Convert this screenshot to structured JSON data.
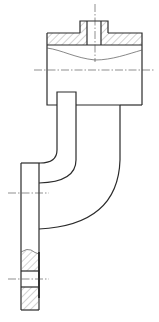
{
  "drawing": {
    "type": "mechanical-section-drawing",
    "subject": "curved pipe elbow with rectangular housing and flange",
    "colors": {
      "background": "#ffffff",
      "line": "#2b2b2b",
      "hatch": "#666666"
    },
    "parts": [
      {
        "name": "top-boss",
        "sectioned": true
      },
      {
        "name": "housing-body",
        "sectioned": true
      },
      {
        "name": "curved-pipe",
        "sectioned": false
      },
      {
        "name": "bottom-flange",
        "sectioned": true
      }
    ],
    "centerlines": [
      {
        "name": "boss-vertical-axis"
      },
      {
        "name": "housing-horizontal-axis"
      },
      {
        "name": "flange-upper-axis"
      },
      {
        "name": "flange-lower-axis"
      }
    ]
  }
}
